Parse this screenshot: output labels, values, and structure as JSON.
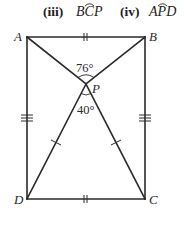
{
  "questions": [
    {
      "number": "(iii)",
      "angle": {
        "first": "B",
        "vertex": "C",
        "last": "P"
      }
    },
    {
      "number": "(iv)",
      "angle": {
        "first": "A",
        "vertex": "P",
        "last": "D"
      }
    }
  ],
  "diagram": {
    "vertices": {
      "A": {
        "label": "A",
        "x": 27,
        "y": 37
      },
      "B": {
        "label": "B",
        "x": 145,
        "y": 37
      },
      "C": {
        "label": "C",
        "x": 145,
        "y": 199
      },
      "D": {
        "label": "D",
        "x": 27,
        "y": 199
      },
      "P": {
        "label": "P",
        "x": 86,
        "y": 84
      }
    },
    "angles": {
      "APB": "76°",
      "DPC": "40°"
    },
    "equal_marks": {
      "AB_DC": "double tick",
      "AD_BC": "triple tick",
      "PD_PC": "single tick"
    },
    "line_color": "#2a2a2a"
  }
}
